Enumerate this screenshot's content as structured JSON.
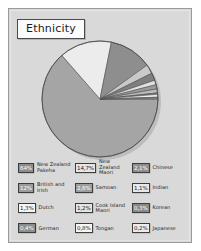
{
  "title": "Ethnicity",
  "colors": {
    "panel_bg": "#d9d9d9",
    "panel_border": "#9a9a9a",
    "title_bg": "#fbfbfb",
    "title_border": "#4a4a4a",
    "slice_main": "#a3a3a3",
    "slice_light": "#e8e8e8",
    "slice_dark": "#8a8a8a",
    "slice_edge": "#555555",
    "text": "#232323"
  },
  "chart_data": {
    "type": "pie",
    "title": "Ethnicity",
    "xlabel": "",
    "ylabel": "",
    "legend_position": "bottom",
    "grid": false,
    "categories": [
      "New Zealand Pakeha",
      "New Zealand Maori",
      "British and Irish",
      "Samoan",
      "Chinese",
      "Dutch",
      "Cook Island Maori",
      "Indian",
      "German",
      "Tongan",
      "Korean",
      "Japanese"
    ],
    "values": [
      64,
      14.7,
      12,
      2.6,
      2.1,
      1.3,
      1.2,
      1.1,
      0.4,
      0.8,
      0.3,
      0.2
    ],
    "unit": "%"
  },
  "legend": {
    "rows": [
      {
        "cells": [
          {
            "value": "64%",
            "label": "New Zealand Pakeha",
            "fill": "#8d8d8d",
            "fg": "#ffffff"
          },
          {
            "value": "14,7%",
            "label": "New Zealand Maori",
            "fill": "#e6e6e6",
            "fg": "#1c1c1c"
          },
          {
            "value": "2,1%",
            "label": "Chinese",
            "fill": "#8f8f8f",
            "fg": "#ffffff"
          }
        ]
      },
      {
        "cells": [
          {
            "value": "12%",
            "label": "British and Irish",
            "fill": "#9b9b9b",
            "fg": "#ffffff"
          },
          {
            "value": "2,6%",
            "label": "Samoan",
            "fill": "#9f9f9f",
            "fg": "#ffffff"
          },
          {
            "value": "1,1%",
            "label": "Indian",
            "fill": "#e9e9e9",
            "fg": "#1c1c1c"
          }
        ]
      },
      {
        "cells": [
          {
            "value": "1,3%",
            "label": "Dutch",
            "fill": "#f4f4f4",
            "fg": "#1c1c1c"
          },
          {
            "value": "1,2%",
            "label": "Cook Island Maori",
            "fill": "#e3e3e3",
            "fg": "#1c1c1c"
          },
          {
            "value": "0,3%",
            "label": "Korean",
            "fill": "#8b8b8b",
            "fg": "#ffffff"
          }
        ]
      },
      {
        "cells": [
          {
            "value": "0,4%",
            "label": "German",
            "fill": "#8d8d8d",
            "fg": "#ffffff"
          },
          {
            "value": "0,8%",
            "label": "Tongan",
            "fill": "#f6f6f6",
            "fg": "#1c1c1c"
          },
          {
            "value": "0,2%",
            "label": "Japanese",
            "fill": "#ececec",
            "fg": "#1c1c1c"
          }
        ]
      }
    ]
  }
}
